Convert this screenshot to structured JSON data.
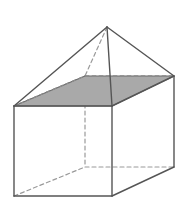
{
  "figure": {
    "name": "composite-solid-prism-with-pyramid",
    "canvas": {
      "width": 185,
      "height": 211,
      "background": "#ffffff"
    },
    "style": {
      "solid_stroke": "#555555",
      "hidden_stroke": "#9a9a9a",
      "shaded_face_fill": "#a9a9a9",
      "shaded_face_stroke": "#6b6b6b",
      "stroke_width": 1.4,
      "hidden_stroke_width": 1.2,
      "hidden_dash": "4,3"
    },
    "vertices": {
      "apex": {
        "label": "apex",
        "x": 107,
        "y": 27,
        "hidden": false
      },
      "front_top_left": {
        "label": "front-top-left",
        "x": 14,
        "y": 106,
        "hidden": false
      },
      "front_top_right": {
        "label": "front-top-right",
        "x": 112,
        "y": 106,
        "hidden": false
      },
      "back_top_right": {
        "label": "back-top-right",
        "x": 174,
        "y": 76,
        "hidden": false
      },
      "back_top_left": {
        "label": "back-top-left",
        "x": 85,
        "y": 76,
        "hidden": true
      },
      "front_bottom_left": {
        "label": "front-bottom-left",
        "x": 14,
        "y": 196,
        "hidden": false
      },
      "front_bottom_right": {
        "label": "front-bottom-right",
        "x": 112,
        "y": 196,
        "hidden": false
      },
      "back_bottom_right": {
        "label": "back-bottom-right",
        "x": 174,
        "y": 167,
        "hidden": false
      },
      "back_bottom_left": {
        "label": "back-bottom-left",
        "x": 85,
        "y": 167,
        "hidden": true
      }
    },
    "shaded_face": {
      "name": "top-face",
      "points": "14,106 85,76 174,76 112,106",
      "fill": "#a9a9a9"
    },
    "faces": {
      "prism_front": {
        "points": "14,106 112,106 112,196 14,196"
      },
      "prism_right": {
        "points": "112,106 174,76 174,167 112,196"
      }
    },
    "edges": {
      "visible": [
        {
          "name": "pyramid-edge-apex-to-front-top-left",
          "x1": 107,
          "y1": 27,
          "x2": 14,
          "y2": 106
        },
        {
          "name": "pyramid-edge-apex-to-back-top-right",
          "x1": 107,
          "y1": 27,
          "x2": 174,
          "y2": 76
        },
        {
          "name": "pyramid-edge-apex-to-front-top-right",
          "x1": 107,
          "y1": 27,
          "x2": 112,
          "y2": 106
        },
        {
          "name": "prism-top-front-edge",
          "x1": 14,
          "y1": 106,
          "x2": 112,
          "y2": 106
        },
        {
          "name": "prism-top-right-edge",
          "x1": 112,
          "y1": 106,
          "x2": 174,
          "y2": 76
        },
        {
          "name": "prism-left-vertical-edge",
          "x1": 14,
          "y1": 106,
          "x2": 14,
          "y2": 196
        },
        {
          "name": "prism-front-right-vertical-edge",
          "x1": 112,
          "y1": 106,
          "x2": 112,
          "y2": 196
        },
        {
          "name": "prism-back-right-vertical-edge",
          "x1": 174,
          "y1": 76,
          "x2": 174,
          "y2": 167
        },
        {
          "name": "prism-bottom-front-edge",
          "x1": 14,
          "y1": 196,
          "x2": 112,
          "y2": 196
        },
        {
          "name": "prism-bottom-right-edge",
          "x1": 112,
          "y1": 196,
          "x2": 174,
          "y2": 167
        }
      ],
      "hidden": [
        {
          "name": "pyramid-edge-apex-to-back-top-left",
          "x1": 107,
          "y1": 27,
          "x2": 85,
          "y2": 76
        },
        {
          "name": "prism-top-back-left-edge",
          "x1": 14,
          "y1": 106,
          "x2": 85,
          "y2": 76
        },
        {
          "name": "prism-top-back-edge",
          "x1": 85,
          "y1": 76,
          "x2": 174,
          "y2": 76
        },
        {
          "name": "prism-back-left-vertical-edge",
          "x1": 85,
          "y1": 76,
          "x2": 85,
          "y2": 167
        },
        {
          "name": "prism-bottom-back-left-edge",
          "x1": 14,
          "y1": 196,
          "x2": 85,
          "y2": 167
        },
        {
          "name": "prism-bottom-back-edge",
          "x1": 85,
          "y1": 167,
          "x2": 174,
          "y2": 167
        }
      ]
    }
  }
}
